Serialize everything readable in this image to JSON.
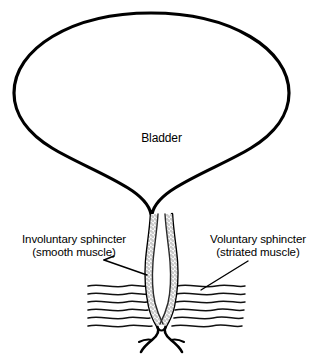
{
  "figure": {
    "background_color": "#ffffff",
    "ink_color": "#000000",
    "stipple_color": "#8c8c8c",
    "width": 323,
    "height": 364
  },
  "labels": {
    "bladder": "Bladder",
    "involuntary_line1": "Involuntary sphincter",
    "involuntary_line2": "(smooth muscle)",
    "voluntary_line1": "Voluntary sphincter",
    "voluntary_line2": "(striated muscle)"
  },
  "structures": {
    "bladder_name": "bladder-outline",
    "urethra_name": "urethra-outline",
    "internal_sphincter_name": "internal-sphincter-stipple",
    "external_muscle_name": "striated-muscle-fibers",
    "muscle_fiber_count": 6
  }
}
